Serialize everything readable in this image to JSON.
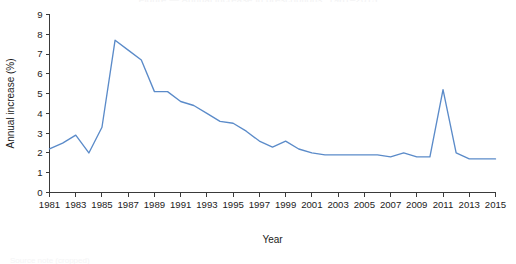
{
  "figure": {
    "cut_title": "Figure — Annual increase in prescriptions, 1981–2015",
    "cut_caption": "Source note (cropped)"
  },
  "chart_data": {
    "type": "line",
    "title": "",
    "xlabel": "Year",
    "ylabel": "Annual increase (%)",
    "xlim": [
      1981,
      2015
    ],
    "ylim": [
      0,
      9
    ],
    "grid": false,
    "legend": null,
    "line_color": "#5b8bc9",
    "axis_color": "#3a3a3a",
    "x_tick_labels": [
      "1981",
      "1983",
      "1985",
      "1987",
      "1989",
      "1991",
      "1993",
      "1995",
      "1997",
      "1999",
      "2001",
      "2003",
      "2005",
      "2007",
      "2009",
      "2011",
      "2013",
      "2015"
    ],
    "x_tick_values": [
      1981,
      1983,
      1985,
      1987,
      1989,
      1991,
      1993,
      1995,
      1997,
      1999,
      2001,
      2003,
      2005,
      2007,
      2009,
      2011,
      2013,
      2015
    ],
    "y_tick_labels": [
      "0",
      "1",
      "2",
      "3",
      "4",
      "5",
      "6",
      "7",
      "8",
      "9"
    ],
    "y_tick_values": [
      0,
      1,
      2,
      3,
      4,
      5,
      6,
      7,
      8,
      9
    ],
    "x": [
      1981,
      1982,
      1983,
      1984,
      1985,
      1986,
      1987,
      1988,
      1989,
      1990,
      1991,
      1992,
      1993,
      1994,
      1995,
      1996,
      1997,
      1998,
      1999,
      2000,
      2001,
      2002,
      2003,
      2004,
      2005,
      2006,
      2007,
      2008,
      2009,
      2010,
      2011,
      2012,
      2013,
      2014,
      2015
    ],
    "values": [
      2.2,
      2.5,
      2.9,
      2.0,
      3.3,
      7.7,
      7.2,
      6.7,
      5.1,
      5.1,
      4.6,
      4.4,
      4.0,
      3.6,
      3.5,
      3.1,
      2.6,
      2.3,
      2.6,
      2.2,
      2.0,
      1.9,
      1.9,
      1.9,
      1.9,
      1.9,
      1.8,
      2.0,
      1.8,
      1.8,
      5.2,
      2.0,
      1.7,
      1.7,
      1.7
    ]
  }
}
